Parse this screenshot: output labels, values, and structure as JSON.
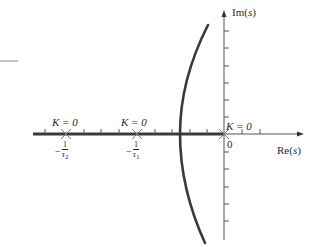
{
  "figure": {
    "type": "root-locus",
    "axes": {
      "imaginary": {
        "label": "Im(s)",
        "label_main": "Im",
        "label_var": "s"
      },
      "real": {
        "label": "Re(s)",
        "label_main": "Re",
        "label_var": "s"
      }
    },
    "poles": [
      {
        "id": "pole-tau2",
        "gain_label": "K = 0",
        "location_label": "-1/τ2",
        "numerator": "1",
        "denominator_symbol": "τ",
        "denominator_sub": "2"
      },
      {
        "id": "pole-tau1",
        "gain_label": "K = 0",
        "location_label": "-1/τ1",
        "numerator": "1",
        "denominator_symbol": "τ",
        "denominator_sub": "1"
      },
      {
        "id": "pole-origin",
        "gain_label": "K = 0",
        "location_label": "0"
      }
    ],
    "origin_label": "0",
    "minus_sign": "−",
    "colors": {
      "ink": "#2a2a2a",
      "locus": "#3a3a3a",
      "axis_thin": "#555555",
      "axis_thick": "#3a3a3a",
      "marker": "#777777",
      "fragment": "#9a9a9a"
    }
  }
}
